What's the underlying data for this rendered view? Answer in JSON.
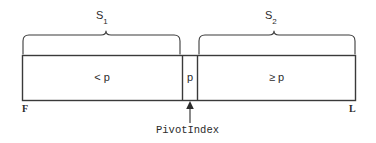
{
  "diagram": {
    "stroke_color": "#3a3a3a",
    "text_color": "#2b2b2b",
    "background_color": "#ffffff",
    "braces": [
      {
        "name": "S",
        "subscript": "1",
        "label": "S1",
        "spans": "left-partition"
      },
      {
        "name": "S",
        "subscript": "2",
        "label": "S2",
        "spans": "right-partition"
      }
    ],
    "cells": [
      {
        "id": "left-partition",
        "label": "< p"
      },
      {
        "id": "pivot",
        "label": "p"
      },
      {
        "id": "right-partition",
        "label": "≥ p"
      }
    ],
    "endpoints": {
      "first": "F",
      "last": "L"
    },
    "pointer": {
      "label": "PivotIndex",
      "points_to": "pivot"
    }
  }
}
